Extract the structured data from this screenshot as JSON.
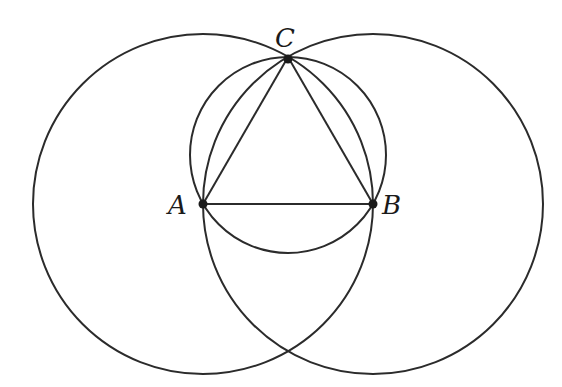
{
  "diagram": {
    "stroke_color": "#2b2b2b",
    "background": "#ffffff",
    "points": {
      "A": {
        "label": "A",
        "x": 203,
        "y": 204
      },
      "B": {
        "label": "B",
        "x": 373,
        "y": 204
      },
      "C": {
        "label": "C",
        "x": 288,
        "y": 57
      }
    },
    "circles": [
      {
        "name": "circle-centered-A",
        "cx": 203,
        "cy": 204,
        "r": 170
      },
      {
        "name": "circle-centered-B",
        "cx": 373,
        "cy": 204,
        "r": 170
      },
      {
        "name": "circumcircle-ABC",
        "cx": 288,
        "cy": 155,
        "r": 98
      }
    ],
    "segments": [
      [
        "A",
        "B"
      ],
      [
        "A",
        "C"
      ],
      [
        "B",
        "C"
      ]
    ]
  }
}
